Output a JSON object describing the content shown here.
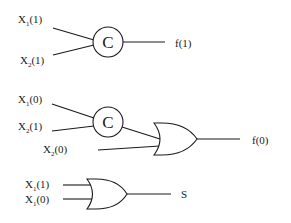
{
  "diagram": {
    "circuit1": {
      "inputs": [
        {
          "var": "X",
          "sub": "1",
          "arg": "(1)"
        },
        {
          "var": "X",
          "sub": "2",
          "arg": "(1)"
        }
      ],
      "gate_label": "C",
      "output": "f(1)"
    },
    "circuit2": {
      "inputs": [
        {
          "var": "X",
          "sub": "1",
          "arg": "(0)"
        },
        {
          "var": "X",
          "sub": "2",
          "arg": "(1)"
        },
        {
          "var": "X",
          "sub": "2",
          "arg": "(0)"
        }
      ],
      "gate_label": "C",
      "or_gate": "OR",
      "output": "f(0)"
    },
    "circuit3": {
      "inputs": [
        {
          "var": "X",
          "sub": "1",
          "arg": "(1)"
        },
        {
          "var": "X",
          "sub": "1",
          "arg": "(0)"
        }
      ],
      "or_gate": "OR",
      "output": "S"
    }
  }
}
